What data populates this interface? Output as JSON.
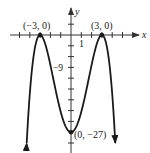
{
  "chart_data": {
    "type": "line",
    "title": "",
    "xlabel": "x",
    "ylabel": "y",
    "function": "f(x) = -(x^2 - 9)^2 / 3",
    "x_tick_spacing": 1,
    "y_tick_spacing": 3,
    "tick_labels": {
      "x": [
        "1"
      ],
      "y": [
        "-9"
      ]
    },
    "annotated_points": [
      {
        "label": "(−3, 0)",
        "x": -3,
        "y": 0
      },
      {
        "label": "(3, 0)",
        "x": 3,
        "y": 0
      },
      {
        "label": "(0, −27)",
        "x": 0,
        "y": -27
      }
    ],
    "x": [
      -4.3,
      -4,
      -3.5,
      -3,
      -2.5,
      -2,
      -1.5,
      -1,
      -0.5,
      0,
      0.5,
      1,
      1.5,
      2,
      2.5,
      3,
      3.5,
      4,
      4.3
    ],
    "values": [
      -30.4,
      -16.3,
      -3.5,
      0,
      -2.5,
      -8.3,
      -15.2,
      -21.3,
      -25.4,
      -27,
      -25.4,
      -21.3,
      -15.2,
      -8.3,
      -2.5,
      0,
      -3.5,
      -16.3,
      -30.4
    ],
    "xlim": [
      -6,
      6.5
    ],
    "ylim": [
      -32,
      7.5
    ],
    "grid": false,
    "legend": null,
    "ends_with_arrows": true
  },
  "labels": {
    "x_axis": "x",
    "y_axis": "y",
    "x_tick_1": "1",
    "y_tick_neg9": "−9",
    "point_left": "(−3, 0)",
    "point_right": "(3, 0)",
    "point_min": "(0, −27)"
  },
  "colors": {
    "curve": "#1a1a1a",
    "axis": "#333333",
    "text": "#222222"
  }
}
